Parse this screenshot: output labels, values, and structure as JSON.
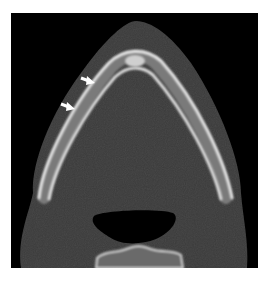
{
  "figure": {
    "modality": "CT axial",
    "colors": {
      "background": "#000000",
      "soft_tissue": "#3b3b3b",
      "bone_cortex": "#e8e8e8",
      "bone_marrow": "#8a8a8a",
      "airway": "#000000",
      "arrow": "#ffffff"
    },
    "annotations": [
      {
        "type": "arrow",
        "name": "arrow-1"
      },
      {
        "type": "arrow",
        "name": "arrow-2"
      }
    ]
  }
}
